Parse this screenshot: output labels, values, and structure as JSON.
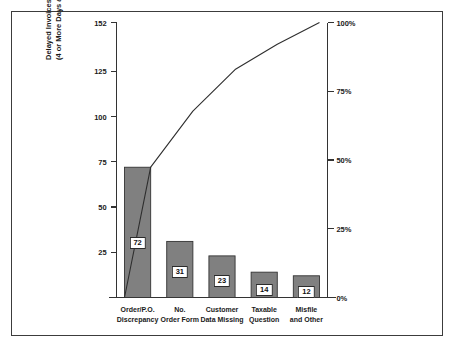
{
  "chart_data": {
    "type": "bar",
    "title": "",
    "subtitle": "",
    "xlabel": "",
    "ylabel": "Delayed Invoices (4 or More Days after P.O. Received)",
    "ylabel_line1": "Delayed Invoices",
    "ylabel_line2": "(4 or More Days after P.O. Received)",
    "categories": [
      "Order/P.O. Discrepancy",
      "No. Order Form",
      "Customer Data Missing",
      "Taxable Question",
      "Misfile and Other"
    ],
    "category_lines": [
      [
        "Order/P.O.",
        "Discrepancy"
      ],
      [
        "No.",
        "Order Form"
      ],
      [
        "Customer",
        "Data Missing"
      ],
      [
        "Taxable",
        "Question"
      ],
      [
        "Misfile",
        "and Other"
      ]
    ],
    "values": [
      72,
      31,
      23,
      14,
      12
    ],
    "value_labels": [
      "72",
      "31",
      "23",
      "14",
      "12"
    ],
    "total": 152,
    "cumulative_values": [
      72,
      103,
      126,
      140,
      152
    ],
    "cumulative_percents": [
      47.4,
      67.8,
      82.9,
      92.1,
      100.0
    ],
    "ylim": [
      0,
      152
    ],
    "yticks": [
      0,
      25,
      50,
      75,
      100,
      125,
      152
    ],
    "ytick_labels": [
      "25",
      "50",
      "75",
      "100",
      "125",
      "152"
    ],
    "ytick_values": [
      25,
      50,
      75,
      100,
      125,
      152
    ],
    "y2lim": [
      0,
      100
    ],
    "y2ticks": [
      0,
      25,
      50,
      75,
      100
    ],
    "y2tick_labels": [
      "0%",
      "25%",
      "50%",
      "75%",
      "100%"
    ],
    "y2tick_values": [
      0,
      25,
      50,
      75,
      100
    ],
    "grid": false,
    "legend": false,
    "legend_position": "none",
    "series": [
      {
        "name": "Delayed Invoices",
        "type": "bar",
        "values": [
          72,
          31,
          23,
          14,
          12
        ]
      },
      {
        "name": "Cumulative Percent",
        "type": "line",
        "values": [
          47.4,
          67.8,
          82.9,
          92.1,
          100.0
        ]
      }
    ],
    "colors": {
      "bar_fill": "#808080",
      "bar_edge": "#333333",
      "line": "#2e2e2e",
      "axis": "#333333",
      "frame": "#3c3c3c",
      "text": "#1a1a1a",
      "value_box_fill": "#ffffff"
    }
  }
}
